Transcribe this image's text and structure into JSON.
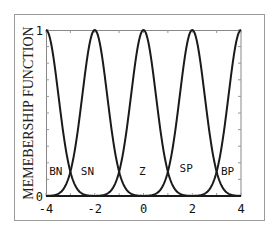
{
  "chart_data": {
    "type": "line",
    "title": "",
    "xlabel": "",
    "ylabel": "MEMEBERSHIP FUNCTION",
    "xlim": [
      -4,
      4
    ],
    "ylim": [
      0,
      1
    ],
    "grid": false,
    "x_ticks": [
      -4,
      -2,
      0,
      2,
      4
    ],
    "x_tick_labels": [
      "-4",
      "-2",
      "0",
      "2",
      "4"
    ],
    "y_ticks": [
      0,
      1
    ],
    "y_tick_labels": [
      "0",
      "1"
    ],
    "curve_shape": "gaussian",
    "sigma": 0.51,
    "series": [
      {
        "name": "BN",
        "center": -4,
        "peak": 1,
        "label_x": -3.6,
        "label_y": 0.15
      },
      {
        "name": "SN",
        "center": -2,
        "peak": 1,
        "label_x": -2.3,
        "label_y": 0.15
      },
      {
        "name": "Z",
        "center": 0,
        "peak": 1,
        "label_x": -0.05,
        "label_y": 0.15
      },
      {
        "name": "SP",
        "center": 2,
        "peak": 1,
        "label_x": 1.75,
        "label_y": 0.17
      },
      {
        "name": "BP",
        "center": 4,
        "peak": 1,
        "label_x": 3.45,
        "label_y": 0.15
      }
    ],
    "crossover_points": [
      {
        "x": -3,
        "y": 0.15
      },
      {
        "x": -1,
        "y": 0.15
      },
      {
        "x": 1,
        "y": 0.15
      },
      {
        "x": 3,
        "y": 0.15
      }
    ],
    "legend": "inline labels near baseline"
  }
}
